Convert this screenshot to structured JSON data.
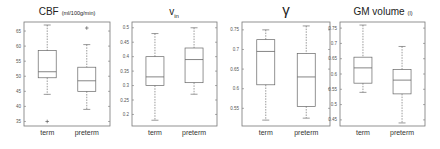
{
  "chart_data": [
    {
      "type": "box",
      "title": "CBF",
      "title_unit": "(ml/100g/min)",
      "categories": [
        "term",
        "preterm"
      ],
      "yticks": [
        35,
        40,
        45,
        50,
        55,
        60,
        65
      ],
      "ylim": [
        33.5,
        68
      ],
      "boxes": [
        {
          "name": "term",
          "whisker_low": 44,
          "q1": 49.5,
          "median": 51.5,
          "q3": 58.5,
          "whisker_high": 67,
          "outliers": [
            35
          ]
        },
        {
          "name": "preterm",
          "whisker_low": 39,
          "q1": 45,
          "median": 48.5,
          "q3": 53,
          "whisker_high": 60.5,
          "outliers": [
            66
          ]
        }
      ]
    },
    {
      "type": "box",
      "title": "v",
      "title_sub": "in",
      "categories": [
        "term",
        "preterm"
      ],
      "yticks": [
        0.2,
        0.25,
        0.3,
        0.35,
        0.4,
        0.45,
        0.5
      ],
      "ylim": [
        0.16,
        0.52
      ],
      "boxes": [
        {
          "name": "term",
          "whisker_low": 0.18,
          "q1": 0.3,
          "median": 0.33,
          "q3": 0.4,
          "whisker_high": 0.48,
          "outliers": []
        },
        {
          "name": "preterm",
          "whisker_low": 0.27,
          "q1": 0.31,
          "median": 0.39,
          "q3": 0.43,
          "whisker_high": 0.5,
          "outliers": []
        }
      ]
    },
    {
      "type": "box",
      "title": "γ",
      "categories": [
        "term",
        "preterm"
      ],
      "yticks": [
        0.55,
        0.6,
        0.65,
        0.7,
        0.75
      ],
      "ylim": [
        0.505,
        0.77
      ],
      "boxes": [
        {
          "name": "term",
          "whisker_low": 0.52,
          "q1": 0.61,
          "median": 0.695,
          "q3": 0.725,
          "whisker_high": 0.75,
          "outliers": []
        },
        {
          "name": "preterm",
          "whisker_low": 0.525,
          "q1": 0.555,
          "median": 0.63,
          "q3": 0.69,
          "whisker_high": 0.76,
          "outliers": []
        }
      ]
    },
    {
      "type": "box",
      "title": "GM volume",
      "title_unit": "(l)",
      "categories": [
        "term",
        "preterm"
      ],
      "yticks": [
        0.45,
        0.5,
        0.55,
        0.6,
        0.65,
        0.7,
        0.75
      ],
      "ylim": [
        0.43,
        0.77
      ],
      "boxes": [
        {
          "name": "term",
          "whisker_low": 0.54,
          "q1": 0.57,
          "median": 0.62,
          "q3": 0.655,
          "whisker_high": 0.76,
          "outliers": []
        },
        {
          "name": "preterm",
          "whisker_low": 0.44,
          "q1": 0.535,
          "median": 0.58,
          "q3": 0.615,
          "whisker_high": 0.69,
          "outliers": []
        }
      ]
    }
  ],
  "layout": {
    "panels": [
      {
        "x0": 24,
        "x1": 110,
        "y0": 22,
        "y1": 126,
        "title_x": 67
      },
      {
        "x0": 132,
        "x1": 217,
        "y0": 22,
        "y1": 126,
        "title_x": 174
      },
      {
        "x0": 242,
        "x1": 330,
        "y0": 22,
        "y1": 126,
        "title_x": 286
      },
      {
        "x0": 340,
        "x1": 425,
        "y0": 22,
        "y1": 126,
        "title_x": 383
      }
    ]
  }
}
